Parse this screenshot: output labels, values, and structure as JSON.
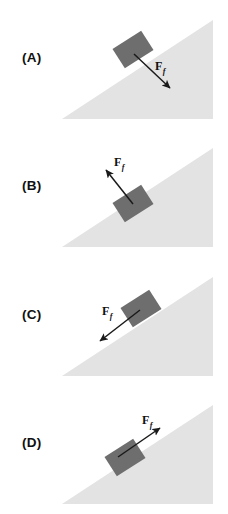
{
  "figure": {
    "type": "physics-free-body-diagram",
    "incline": {
      "angle_degrees": 30,
      "fill_color": "#e3e3e3",
      "apex_x": 213,
      "base_left_x": 62,
      "base_y": 119
    },
    "block": {
      "fill_color": "#6e6e6e",
      "width": 34,
      "height": 23,
      "rotation_degrees": 30
    },
    "arrow_color": "#1a1a1a"
  },
  "panels": [
    {
      "id": "A",
      "label": "(A)",
      "force": {
        "symbol": "F",
        "subscript": "f",
        "label_text": "F",
        "direction": "down-slope",
        "direction_degrees": 30,
        "tail_x": 134,
        "tail_y": 54,
        "head_x": 172,
        "head_y": 89,
        "label_x": 155,
        "label_y": 68
      }
    },
    {
      "id": "B",
      "label": "(B)",
      "force": {
        "symbol": "F",
        "subscript": "f",
        "label_text": "F",
        "direction": "up-slope",
        "direction_degrees": 210,
        "tail_x": 134,
        "tail_y": 54,
        "head_x": 104,
        "head_y": 24,
        "label_x": 114,
        "label_y": 20
      }
    },
    {
      "id": "C",
      "label": "(C)",
      "force": {
        "symbol": "F",
        "subscript": "f",
        "label_text": "F",
        "direction": "down-left-away-from-surface",
        "direction_degrees": 205,
        "tail_x": 140,
        "tail_y": 52,
        "head_x": 96,
        "head_y": 85,
        "label_x": 104,
        "label_y": 58
      }
    },
    {
      "id": "D",
      "label": "(D)",
      "force": {
        "symbol": "F",
        "subscript": "f",
        "label_text": "F",
        "direction": "up-right-away-from-surface",
        "direction_degrees": 25,
        "tail_x": 118,
        "tail_y": 72,
        "head_x": 164,
        "head_y": 40,
        "label_x": 145,
        "label_y": 33
      }
    }
  ]
}
